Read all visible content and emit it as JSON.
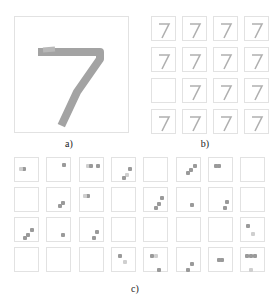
{
  "figure": {
    "panel_a": {
      "caption": "a)",
      "description": "Input MNIST digit 7"
    },
    "panel_b": {
      "caption": "b)",
      "grid": [
        4,
        4
      ],
      "description": "Reconstructed digit 7 variants"
    },
    "panel_c": {
      "caption": "c)",
      "grid": [
        4,
        8
      ],
      "description": "Sparse feature activation maps"
    },
    "colors": {
      "stroke": "#a0a0a0",
      "border": "#e2e2e2",
      "background": "#ffffff"
    }
  }
}
